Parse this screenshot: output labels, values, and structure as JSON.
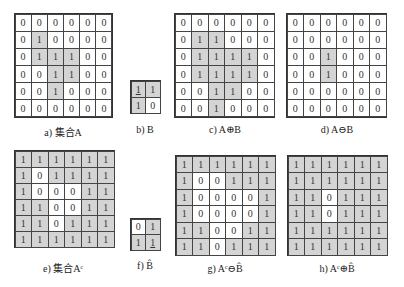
{
  "figure": {
    "panels": [
      {
        "id": "a",
        "caption": "a) 集合A",
        "rows": [
          [
            0,
            0,
            0,
            0,
            0,
            0
          ],
          [
            0,
            1,
            0,
            0,
            0,
            0
          ],
          [
            0,
            1,
            1,
            1,
            0,
            0
          ],
          [
            0,
            0,
            1,
            1,
            0,
            0
          ],
          [
            0,
            0,
            1,
            0,
            0,
            0
          ],
          [
            0,
            0,
            0,
            0,
            0,
            0
          ]
        ],
        "shaded": [
          [
            0,
            0,
            0,
            0,
            0,
            0
          ],
          [
            0,
            1,
            0,
            0,
            0,
            0
          ],
          [
            0,
            1,
            1,
            1,
            0,
            0
          ],
          [
            0,
            0,
            1,
            1,
            0,
            0
          ],
          [
            0,
            0,
            1,
            0,
            0,
            0
          ],
          [
            0,
            0,
            0,
            0,
            0,
            0
          ]
        ],
        "box": {
          "x": 14,
          "y": 13,
          "w": 99,
          "h": 105
        },
        "caption_pos": {
          "x": 63,
          "y": 124
        }
      },
      {
        "id": "b",
        "caption": "b) B",
        "rows": [
          [
            1,
            1
          ],
          [
            1,
            0
          ]
        ],
        "shaded": [
          [
            1,
            1
          ],
          [
            1,
            0
          ]
        ],
        "origin": [
          0,
          0
        ],
        "box": {
          "x": 130,
          "y": 80,
          "w": 31,
          "h": 34
        },
        "caption_pos": {
          "x": 145,
          "y": 124
        }
      },
      {
        "id": "c",
        "caption": "c) A⊕B",
        "rows": [
          [
            0,
            0,
            0,
            0,
            0,
            0
          ],
          [
            0,
            1,
            1,
            0,
            0,
            0
          ],
          [
            0,
            1,
            1,
            1,
            1,
            0
          ],
          [
            0,
            1,
            1,
            1,
            1,
            0
          ],
          [
            0,
            0,
            1,
            1,
            0,
            0
          ],
          [
            0,
            0,
            1,
            0,
            0,
            0
          ]
        ],
        "shaded": [
          [
            0,
            0,
            0,
            0,
            0,
            0
          ],
          [
            0,
            1,
            1,
            0,
            0,
            0
          ],
          [
            0,
            1,
            1,
            1,
            1,
            0
          ],
          [
            0,
            1,
            1,
            1,
            1,
            0
          ],
          [
            0,
            0,
            1,
            1,
            0,
            0
          ],
          [
            0,
            0,
            1,
            0,
            0,
            0
          ]
        ],
        "box": {
          "x": 174,
          "y": 13,
          "w": 101,
          "h": 105
        },
        "caption_pos": {
          "x": 225,
          "y": 124
        }
      },
      {
        "id": "d",
        "caption": "d) A⊖B",
        "rows": [
          [
            0,
            0,
            0,
            0,
            0,
            0
          ],
          [
            0,
            0,
            0,
            0,
            0,
            0
          ],
          [
            0,
            0,
            1,
            0,
            0,
            0
          ],
          [
            0,
            0,
            1,
            0,
            0,
            0
          ],
          [
            0,
            0,
            0,
            0,
            0,
            0
          ],
          [
            0,
            0,
            0,
            0,
            0,
            0
          ]
        ],
        "shaded": [
          [
            0,
            0,
            0,
            0,
            0,
            0
          ],
          [
            0,
            0,
            0,
            0,
            0,
            0
          ],
          [
            0,
            0,
            1,
            0,
            0,
            0
          ],
          [
            0,
            0,
            1,
            0,
            0,
            0
          ],
          [
            0,
            0,
            0,
            0,
            0,
            0
          ],
          [
            0,
            0,
            0,
            0,
            0,
            0
          ]
        ],
        "box": {
          "x": 286,
          "y": 13,
          "w": 101,
          "h": 105
        },
        "caption_pos": {
          "x": 337,
          "y": 124
        }
      },
      {
        "id": "e",
        "caption": "e) 集合Aᶜ",
        "rows": [
          [
            1,
            1,
            1,
            1,
            1,
            1
          ],
          [
            1,
            0,
            1,
            1,
            1,
            1
          ],
          [
            1,
            0,
            0,
            0,
            1,
            1
          ],
          [
            1,
            1,
            0,
            0,
            1,
            1
          ],
          [
            1,
            1,
            0,
            1,
            1,
            1
          ],
          [
            1,
            1,
            1,
            1,
            1,
            1
          ]
        ],
        "shaded": [
          [
            1,
            1,
            1,
            1,
            1,
            1
          ],
          [
            1,
            0,
            1,
            1,
            1,
            1
          ],
          [
            1,
            0,
            0,
            0,
            1,
            1
          ],
          [
            1,
            1,
            0,
            0,
            1,
            1
          ],
          [
            1,
            1,
            0,
            1,
            1,
            1
          ],
          [
            1,
            1,
            1,
            1,
            1,
            1
          ]
        ],
        "box": {
          "x": 14,
          "y": 150,
          "w": 101,
          "h": 98
        },
        "caption_pos": {
          "x": 63,
          "y": 260
        }
      },
      {
        "id": "f",
        "caption": "f) B̂",
        "rows": [
          [
            0,
            1
          ],
          [
            1,
            1
          ]
        ],
        "shaded": [
          [
            0,
            1
          ],
          [
            1,
            1
          ]
        ],
        "origin": [
          1,
          1
        ],
        "box": {
          "x": 130,
          "y": 218,
          "w": 31,
          "h": 33
        },
        "caption_pos": {
          "x": 145,
          "y": 260
        }
      },
      {
        "id": "g",
        "caption": "g) Aᶜ⊖B̂",
        "rows": [
          [
            1,
            1,
            1,
            1,
            1,
            1
          ],
          [
            1,
            0,
            0,
            1,
            1,
            1
          ],
          [
            1,
            0,
            0,
            0,
            0,
            1
          ],
          [
            1,
            0,
            0,
            0,
            0,
            1
          ],
          [
            1,
            1,
            0,
            0,
            1,
            1
          ],
          [
            1,
            1,
            0,
            1,
            1,
            1
          ]
        ],
        "shaded": [
          [
            1,
            1,
            1,
            1,
            1,
            1
          ],
          [
            1,
            0,
            0,
            1,
            1,
            1
          ],
          [
            1,
            0,
            0,
            0,
            0,
            1
          ],
          [
            1,
            0,
            0,
            0,
            0,
            1
          ],
          [
            1,
            1,
            0,
            0,
            1,
            1
          ],
          [
            1,
            1,
            0,
            1,
            1,
            1
          ]
        ],
        "box": {
          "x": 175,
          "y": 155,
          "w": 101,
          "h": 101
        },
        "caption_pos": {
          "x": 225,
          "y": 263
        }
      },
      {
        "id": "h",
        "caption": "h) Aᶜ⊕B̂",
        "rows": [
          [
            1,
            1,
            1,
            1,
            1,
            1
          ],
          [
            1,
            1,
            1,
            1,
            1,
            1
          ],
          [
            1,
            1,
            0,
            1,
            1,
            1
          ],
          [
            1,
            1,
            0,
            1,
            1,
            1
          ],
          [
            1,
            1,
            1,
            1,
            1,
            1
          ],
          [
            1,
            1,
            1,
            1,
            1,
            1
          ]
        ],
        "shaded": [
          [
            1,
            1,
            1,
            1,
            1,
            1
          ],
          [
            1,
            1,
            1,
            1,
            1,
            1
          ],
          [
            1,
            1,
            0,
            1,
            1,
            1
          ],
          [
            1,
            1,
            0,
            1,
            1,
            1
          ],
          [
            1,
            1,
            1,
            1,
            1,
            1
          ],
          [
            1,
            1,
            1,
            1,
            1,
            1
          ]
        ],
        "box": {
          "x": 287,
          "y": 155,
          "w": 101,
          "h": 101
        },
        "caption_pos": {
          "x": 337,
          "y": 263
        }
      }
    ],
    "colors": {
      "shaded": "#d4d4d4",
      "blank": "#ffffff",
      "grid_line": "#444444"
    }
  }
}
